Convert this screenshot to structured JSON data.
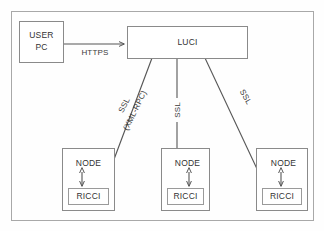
{
  "diagram": {
    "type": "network-architecture-diagram",
    "frame": {
      "label": "diagram-border"
    },
    "colors": {
      "background": "#fefefe",
      "box_stroke": "#8a8a8a",
      "inner_stroke": "#9a9a9a",
      "frame_stroke": "#a8a8a8",
      "line": "#7d7d7d",
      "arrow": "#555555",
      "text": "#333333"
    },
    "nodes": [
      {
        "id": "user-pc",
        "label_line1": "USER",
        "label_line2": "PC",
        "x": 19,
        "y": 21,
        "w": 44,
        "h": 41
      },
      {
        "id": "luci",
        "label": "LUCI",
        "x": 127,
        "y": 26,
        "w": 120,
        "h": 32
      },
      {
        "id": "node-1",
        "label": "NODE",
        "x": 62,
        "y": 148,
        "w": 52,
        "h": 62,
        "child": {
          "id": "ricci-1",
          "label": "RICCI",
          "x": 68,
          "y": 188,
          "w": 40,
          "h": 16
        }
      },
      {
        "id": "node-2",
        "label": "NODE",
        "x": 161,
        "y": 148,
        "w": 48,
        "h": 62,
        "child": {
          "id": "ricci-2",
          "label": "RICCI",
          "x": 167,
          "y": 188,
          "w": 36,
          "h": 16
        }
      },
      {
        "id": "node-3",
        "label": "NODE",
        "x": 256,
        "y": 148,
        "w": 51,
        "h": 62,
        "child": {
          "id": "ricci-3",
          "label": "RICCI",
          "x": 262,
          "y": 188,
          "w": 39,
          "h": 16
        }
      }
    ],
    "edges": [
      {
        "id": "edge-https",
        "label": "HTTPS",
        "from": "user-pc",
        "to": "luci",
        "protocol": "HTTPS",
        "label_x": 95,
        "label_y": 53,
        "rotation": 0
      },
      {
        "id": "edge-ssl-1",
        "label_line1": "SSL",
        "label_line2": "(XML-RPC)",
        "from": "luci",
        "to": "ricci-1",
        "protocol": "SSL (XML-RPC)",
        "label_x": 130,
        "label_y": 108,
        "rotation": -64
      },
      {
        "id": "edge-ssl-2",
        "label": "SSL",
        "from": "luci",
        "to": "ricci-2",
        "protocol": "SSL",
        "label_x": 178,
        "label_y": 110,
        "rotation": -90
      },
      {
        "id": "edge-ssl-3",
        "label": "SSL",
        "from": "luci",
        "to": "ricci-3",
        "protocol": "SSL",
        "label_x": 240,
        "label_y": 100,
        "rotation": 61
      }
    ],
    "internal_links": [
      {
        "id": "node-ricci-link-1",
        "from": "node-1",
        "to": "ricci-1",
        "bidirectional": true
      },
      {
        "id": "node-ricci-link-2",
        "from": "node-2",
        "to": "ricci-2",
        "bidirectional": true
      },
      {
        "id": "node-ricci-link-3",
        "from": "node-3",
        "to": "ricci-3",
        "bidirectional": true
      }
    ]
  }
}
